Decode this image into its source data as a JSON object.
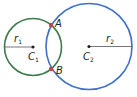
{
  "diagram": {
    "type": "two intersecting circles",
    "circles": [
      {
        "name": "circle-1",
        "center_label": "C",
        "center_sub": "1",
        "radius_label": "r",
        "radius_sub": "1",
        "color": "#3d7a4c",
        "cx": 33,
        "cy": 47,
        "r": 28.5
      },
      {
        "name": "circle-2",
        "center_label": "C",
        "center_sub": "2",
        "radius_label": "r",
        "radius_sub": "2",
        "color": "#3f70c8",
        "cx": 89,
        "cy": 46.5,
        "r": 43
      }
    ],
    "intersection_points": [
      {
        "label": "A",
        "x": 51,
        "y": 25,
        "color": "#c8404a"
      },
      {
        "label": "B",
        "x": 51,
        "y": 69,
        "color": "#c8404a"
      }
    ]
  }
}
